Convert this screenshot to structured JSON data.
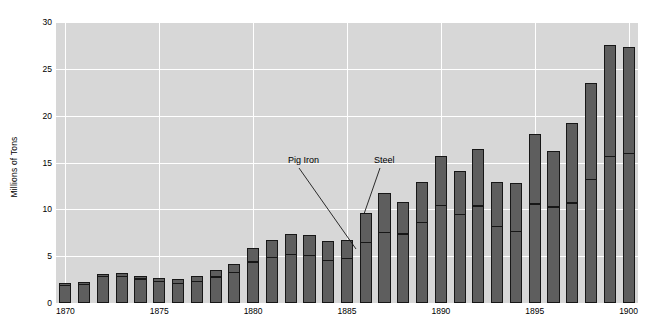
{
  "chart_data": {
    "type": "bar",
    "title": "",
    "subtitle": "",
    "xlabel": "",
    "ylabel": "Millions of Tons",
    "ylim": [
      0,
      30
    ],
    "yticks": [
      0,
      5,
      10,
      15,
      20,
      25,
      30
    ],
    "xticks": [
      1870,
      1875,
      1880,
      1885,
      1890,
      1895,
      1900
    ],
    "xlim": [
      1869.5,
      1900.5
    ],
    "grid": true,
    "legend": "annotations",
    "stacked": true,
    "categories": [
      1870,
      1871,
      1872,
      1873,
      1874,
      1875,
      1876,
      1877,
      1878,
      1879,
      1880,
      1881,
      1882,
      1883,
      1884,
      1885,
      1886,
      1887,
      1888,
      1889,
      1890,
      1891,
      1892,
      1893,
      1894,
      1895,
      1896,
      1897,
      1898,
      1899,
      1900
    ],
    "series": [
      {
        "name": "Pig Iron",
        "values": [
          1.9,
          2.0,
          2.9,
          2.6,
          2.4,
          2.0,
          2.1,
          2.1,
          2.6,
          3.1,
          4.3,
          4.6,
          5.2,
          5.1,
          4.6,
          4.1,
          5.7,
          6.4,
          6.5,
          7.6,
          9.2,
          8.3,
          9.2,
          7.1,
          6.7,
          9.4,
          8.6,
          9.7,
          11.8,
          13.6,
          13.8
        ]
      },
      {
        "name": "Steel",
        "values": [
          0.1,
          0.2,
          0.2,
          0.3,
          0.3,
          0.4,
          0.6,
          0.6,
          0.8,
          0.9,
          1.3,
          1.8,
          1.7,
          1.7,
          1.6,
          1.7,
          2.6,
          3.3,
          2.9,
          3.4,
          4.3,
          3.9,
          4.9,
          4.0,
          4.4,
          6.1,
          5.3,
          7.2,
          9.0,
          10.6,
          10.2
        ]
      }
    ],
    "totals": [
      2.0,
      2.2,
      3.1,
      2.9,
      2.7,
      2.4,
      2.7,
      2.7,
      3.4,
      4.0,
      5.6,
      6.4,
      6.9,
      6.8,
      6.2,
      5.8,
      8.3,
      9.7,
      9.4,
      11.0,
      13.5,
      12.2,
      14.1,
      11.1,
      11.1,
      15.5,
      13.9,
      16.9,
      20.8,
      24.2,
      24.0
    ],
    "bars": [
      {
        "year": 1870,
        "total": 2.1,
        "split": 1.9
      },
      {
        "year": 1871,
        "total": 2.2,
        "split": 2.0
      },
      {
        "year": 1872,
        "total": 3.1,
        "split": 2.9
      },
      {
        "year": 1873,
        "total": 3.2,
        "split": 2.9
      },
      {
        "year": 1874,
        "total": 2.9,
        "split": 2.6
      },
      {
        "year": 1875,
        "total": 2.7,
        "split": 2.3
      },
      {
        "year": 1876,
        "total": 2.6,
        "split": 2.1
      },
      {
        "year": 1877,
        "total": 2.9,
        "split": 2.3
      },
      {
        "year": 1878,
        "total": 3.5,
        "split": 2.8
      },
      {
        "year": 1879,
        "total": 4.2,
        "split": 3.3
      },
      {
        "year": 1880,
        "total": 5.9,
        "split": 4.4
      },
      {
        "year": 1881,
        "total": 6.7,
        "split": 4.9
      },
      {
        "year": 1882,
        "total": 7.4,
        "split": 5.2
      },
      {
        "year": 1883,
        "total": 7.3,
        "split": 5.1
      },
      {
        "year": 1884,
        "total": 6.6,
        "split": 4.6
      },
      {
        "year": 1885,
        "total": 6.7,
        "split": 4.8
      },
      {
        "year": 1886,
        "total": 9.6,
        "split": 6.5
      },
      {
        "year": 1887,
        "total": 11.8,
        "split": 7.6
      },
      {
        "year": 1888,
        "total": 10.8,
        "split": 7.4
      },
      {
        "year": 1889,
        "total": 12.9,
        "split": 8.6
      },
      {
        "year": 1890,
        "total": 15.7,
        "split": 10.4
      },
      {
        "year": 1891,
        "total": 14.1,
        "split": 9.5
      },
      {
        "year": 1892,
        "total": 16.4,
        "split": 10.4
      },
      {
        "year": 1893,
        "total": 12.9,
        "split": 8.2
      },
      {
        "year": 1894,
        "total": 12.8,
        "split": 7.7
      },
      {
        "year": 1895,
        "total": 18.0,
        "split": 10.6
      },
      {
        "year": 1896,
        "total": 16.2,
        "split": 10.3
      },
      {
        "year": 1897,
        "total": 19.2,
        "split": 10.7
      },
      {
        "year": 1898,
        "total": 23.5,
        "split": 13.2
      },
      {
        "year": 1899,
        "total": 27.6,
        "split": 15.7
      },
      {
        "year": 1900,
        "total": 27.3,
        "split": 16.0
      }
    ],
    "annotations": [
      {
        "text": "Pig Iron",
        "label_x": 288,
        "label_y": 156,
        "line_x1": 299,
        "line_y1": 168,
        "line_x2": 356,
        "line_y2": 249
      },
      {
        "text": "Steel",
        "label_x": 374,
        "label_y": 156,
        "line_x1": 380,
        "line_y1": 168,
        "line_x2": 364,
        "line_y2": 214
      }
    ],
    "colors": {
      "plot_background": "#d7d7d7",
      "gridline": "#ffffff",
      "bar_fill": "#5e5e5e",
      "bar_outline": "#171717",
      "page_background": "#ffffff",
      "text": "#000000"
    }
  }
}
